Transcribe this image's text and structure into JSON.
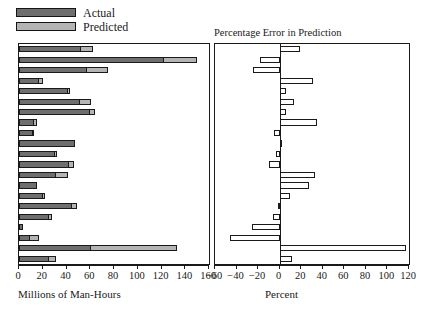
{
  "legend": {
    "items": [
      {
        "label": "Actual",
        "color": "#6e6e6e",
        "icon": "legend-swatch-actual"
      },
      {
        "label": "Predicted",
        "color": "#b4b4b4",
        "icon": "legend-swatch-predicted"
      }
    ]
  },
  "left_panel": {
    "title": "",
    "axis_title": "Millions of Man-Hours",
    "ticks": [
      0,
      20,
      40,
      60,
      80,
      100,
      120,
      140,
      160
    ],
    "tick_labels": [
      "0",
      "20",
      "40",
      "60",
      "80",
      "100",
      "120",
      "140",
      "160"
    ]
  },
  "right_panel": {
    "title": "Percentage Error in Prediction",
    "axis_title": "Percent",
    "ticks": [
      -60,
      -40,
      -20,
      0,
      20,
      40,
      60,
      80,
      100,
      120
    ],
    "tick_labels": [
      "−60",
      "−40",
      "−20",
      "0",
      "20",
      "40",
      "60",
      "80",
      "100",
      "120"
    ]
  },
  "chart_data": [
    {
      "type": "bar",
      "orientation": "horizontal",
      "title": "",
      "xlabel": "Millions of Man-Hours",
      "ylabel": "",
      "xlim": [
        0,
        160
      ],
      "grid": false,
      "legend_position": "above-left",
      "categories": [
        "1",
        "2",
        "3",
        "4",
        "5",
        "6",
        "7",
        "8",
        "9",
        "10",
        "11",
        "12",
        "13",
        "14",
        "15",
        "16",
        "17",
        "18",
        "19",
        "20",
        "21"
      ],
      "series": [
        {
          "name": "Actual",
          "color": "#6e6e6e",
          "values": [
            52.0,
            122.0,
            57.0,
            17.0,
            41.0,
            51.0,
            60.0,
            13.0,
            12.0,
            47.0,
            30.0,
            42.0,
            31.0,
            15.0,
            20.0,
            45.0,
            25.0,
            3.0,
            9.0,
            61.0,
            25.0
          ]
        },
        {
          "name": "Predicted",
          "color": "#b4b4b4",
          "values": [
            62.0,
            150.0,
            75.0,
            20.0,
            43.0,
            61.0,
            64.0,
            15.0,
            12.5,
            47.0,
            32.0,
            46.0,
            41.0,
            14.0,
            22.0,
            49.0,
            28.0,
            2.9,
            16.5,
            133.0,
            31.0
          ]
        }
      ]
    },
    {
      "type": "bar",
      "orientation": "horizontal",
      "title": "Percentage Error in Prediction",
      "xlabel": "Percent",
      "ylabel": "",
      "xlim": [
        -60,
        120
      ],
      "grid": false,
      "categories": [
        "1",
        "2",
        "3",
        "4",
        "5",
        "6",
        "7",
        "8",
        "9",
        "10",
        "11",
        "12",
        "13",
        "14",
        "15",
        "16",
        "17",
        "18",
        "19",
        "20",
        "21"
      ],
      "values": [
        19,
        -18,
        -25,
        31,
        6,
        13,
        6,
        35,
        -5,
        1,
        -3,
        -10,
        33,
        27,
        10,
        -2,
        -6,
        -26,
        -46,
        117,
        11
      ]
    }
  ]
}
